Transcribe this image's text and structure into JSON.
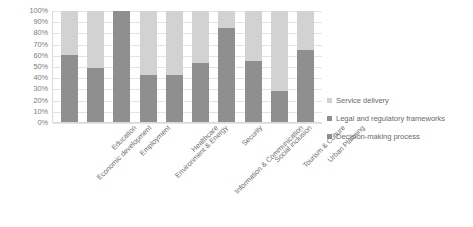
{
  "chart_data": {
    "type": "bar",
    "subtype": "100% stacked bar",
    "title": "",
    "xlabel": "",
    "ylabel": "",
    "ylim": [
      0,
      100
    ],
    "grid": true,
    "legend_position": "right",
    "categories": [
      "Economic development",
      "Education",
      "Employment",
      "Environment & Energy",
      "Healthcare",
      "Information & Communication",
      "Security",
      "Social inclusion",
      "Tourism & Culture",
      "Urban Planning"
    ],
    "ytick_labels": [
      "100%",
      "90%",
      "80%",
      "70%",
      "60%",
      "50%",
      "40%",
      "30%",
      "20%",
      "10%",
      "0%"
    ],
    "ytick_values": [
      100,
      90,
      80,
      70,
      60,
      50,
      40,
      30,
      20,
      10,
      0
    ],
    "series": [
      {
        "name": "Service delivery",
        "color": "#d2d2d2",
        "values": [
          40,
          51,
          0,
          58,
          58,
          47,
          15,
          45,
          72,
          35
        ]
      },
      {
        "name": "Legal and regulatory frameworks",
        "color": "#8f8f8f",
        "values": [
          0,
          0,
          0,
          0,
          0,
          0,
          0,
          0,
          0,
          0
        ]
      },
      {
        "name": "Decision-making process",
        "color": "#8f8f8f",
        "values": [
          60,
          49,
          100,
          42,
          42,
          53,
          85,
          55,
          28,
          65
        ]
      }
    ]
  },
  "legend": {
    "items": [
      {
        "label": "Service delivery",
        "color": "#d2d2d2"
      },
      {
        "label": "Legal and regulatory frameworks",
        "color": "#8f8f8f"
      },
      {
        "label": "Decision-making process",
        "color": "#8f8f8f"
      }
    ]
  }
}
